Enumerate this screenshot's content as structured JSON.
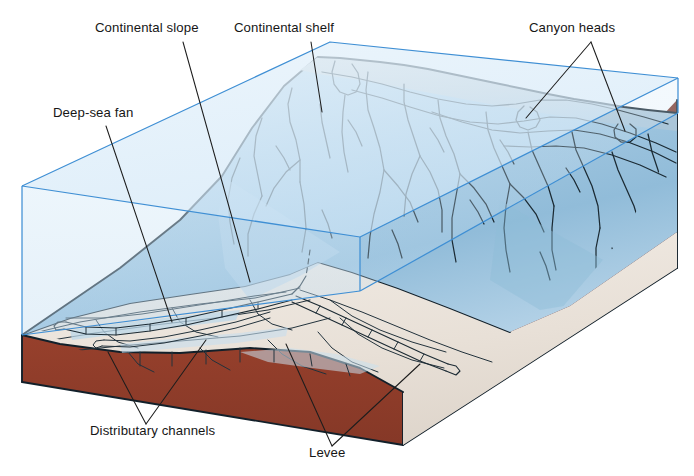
{
  "figure": {
    "background_color": "#ffffff"
  },
  "labels": [
    {
      "id": "continental-slope",
      "text": "Continental slope",
      "x": 95,
      "y": 32,
      "anchor": "start"
    },
    {
      "id": "continental-shelf",
      "text": "Continental shelf",
      "x": 234,
      "y": 32,
      "anchor": "start"
    },
    {
      "id": "canyon-heads",
      "text": "Canyon heads",
      "x": 529,
      "y": 32,
      "anchor": "start"
    },
    {
      "id": "deep-sea-fan",
      "text": "Deep-sea fan",
      "x": 53,
      "y": 117,
      "anchor": "start"
    },
    {
      "id": "distributary-channels",
      "text": "Distributary channels",
      "x": 90,
      "y": 435,
      "anchor": "start"
    },
    {
      "id": "levee",
      "text": "Levee",
      "x": 309,
      "y": 457,
      "anchor": "start"
    }
  ],
  "colors": {
    "water_fill": "#cfe4f4",
    "water_edge": "#3f8fd4",
    "earth_front": "#8c3b29",
    "earth_side": "#7c3122",
    "slope_blue_light": "#bedaec",
    "slope_blue_mid": "#9ec6e0",
    "slope_blue_deep": "#86b4d4",
    "shelf_grey": "#cfd4d6",
    "fan_cream": "#ece5dd",
    "outline": "#12202a",
    "label_text": "#161616"
  },
  "features": {
    "water_block": "translucent blue rectangular prism representing the ocean water column",
    "earth_block": "dark brick-red sediment block beneath the sea floor",
    "continental_shelf": "flat grey shelf top along the upper crest",
    "continental_slope": "steep blue slope dissected by dendritic submarine canyons",
    "deep_sea_fan": "pale cream lobate fan apron at the base of the slope",
    "distributary_channels": "braided channels radiating across the fan surface",
    "levee": "raised ridges flanking the main fan channel",
    "canyon_heads": "notches incised into the shelf edge at the tops of canyons"
  }
}
